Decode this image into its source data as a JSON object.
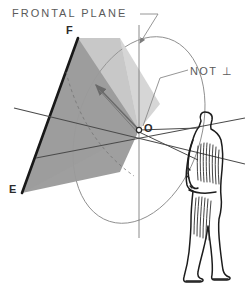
{
  "figure": {
    "background_color": "#ffffff",
    "width": 245,
    "height": 290
  },
  "labels": {
    "frontal_plane": "FRONTAL PLANE",
    "not_perpendicular": "NOT ⊥",
    "point_f": "F",
    "point_o": "O",
    "point_e": "E"
  },
  "colors": {
    "ink": "#2b2b2b",
    "plane_fill": "#9a9a9a",
    "wedge_fill": "#d2d2d2",
    "light_line": "#6f6f6f",
    "leader_line": "#8a8a8a",
    "text": "#5a5a5a"
  },
  "geometry": {
    "origin_point": {
      "x": 139,
      "y": 130
    },
    "point_f": {
      "x": 78,
      "y": 38
    },
    "point_e": {
      "x": 22,
      "y": 193
    },
    "ellipse": {
      "cx": 139,
      "cy": 130,
      "rx": 62,
      "ry": 96,
      "rotation_deg": 18
    },
    "vertical_axis": {
      "x1": 139,
      "y1": 25,
      "x2": 139,
      "y2": 238
    },
    "observer_eye": {
      "x": 198,
      "y": 128
    }
  },
  "elements": {
    "shaded_plane": "dark-gray quadrilateral representing the picture plane FEO",
    "angle_wedge": "light-gray wedge at O marking the non-perpendicular angle",
    "observer": "side-view standing human figure on the right",
    "sight_lines": "two converging rays from the observer's eye to O"
  }
}
